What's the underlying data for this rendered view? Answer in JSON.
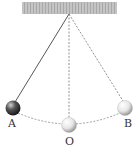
{
  "diagram": {
    "ceiling": {
      "x": 22,
      "y": 2,
      "w": 95,
      "h": 12,
      "color": "#bdbdbd"
    },
    "pivot": {
      "x": 69,
      "y": 14
    },
    "positions": [
      {
        "label": "A",
        "x": 12,
        "y": 108,
        "ball": "dark"
      },
      {
        "label": "O",
        "x": 69,
        "y": 125,
        "ball": "light"
      },
      {
        "label": "B",
        "x": 126,
        "y": 108,
        "ball": "light"
      }
    ],
    "labels": {
      "A": "A",
      "O": "O",
      "B": "B"
    }
  }
}
